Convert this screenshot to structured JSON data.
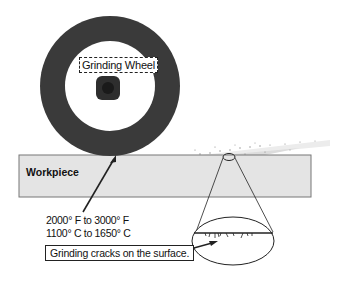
{
  "labels": {
    "wheel": "Grinding Wheel",
    "workpiece": "Workpiece",
    "temp_f": "2000° F to 3000° F",
    "temp_c": "1100° C to 1650° C",
    "cracks": "Grinding cracks on the surface."
  },
  "colors": {
    "wheel": "#3a3a3a",
    "hub": "#2e2e2e",
    "workpiece_fill": "#e4e4e4",
    "workpiece_stroke": "#777777",
    "line": "#222222"
  }
}
